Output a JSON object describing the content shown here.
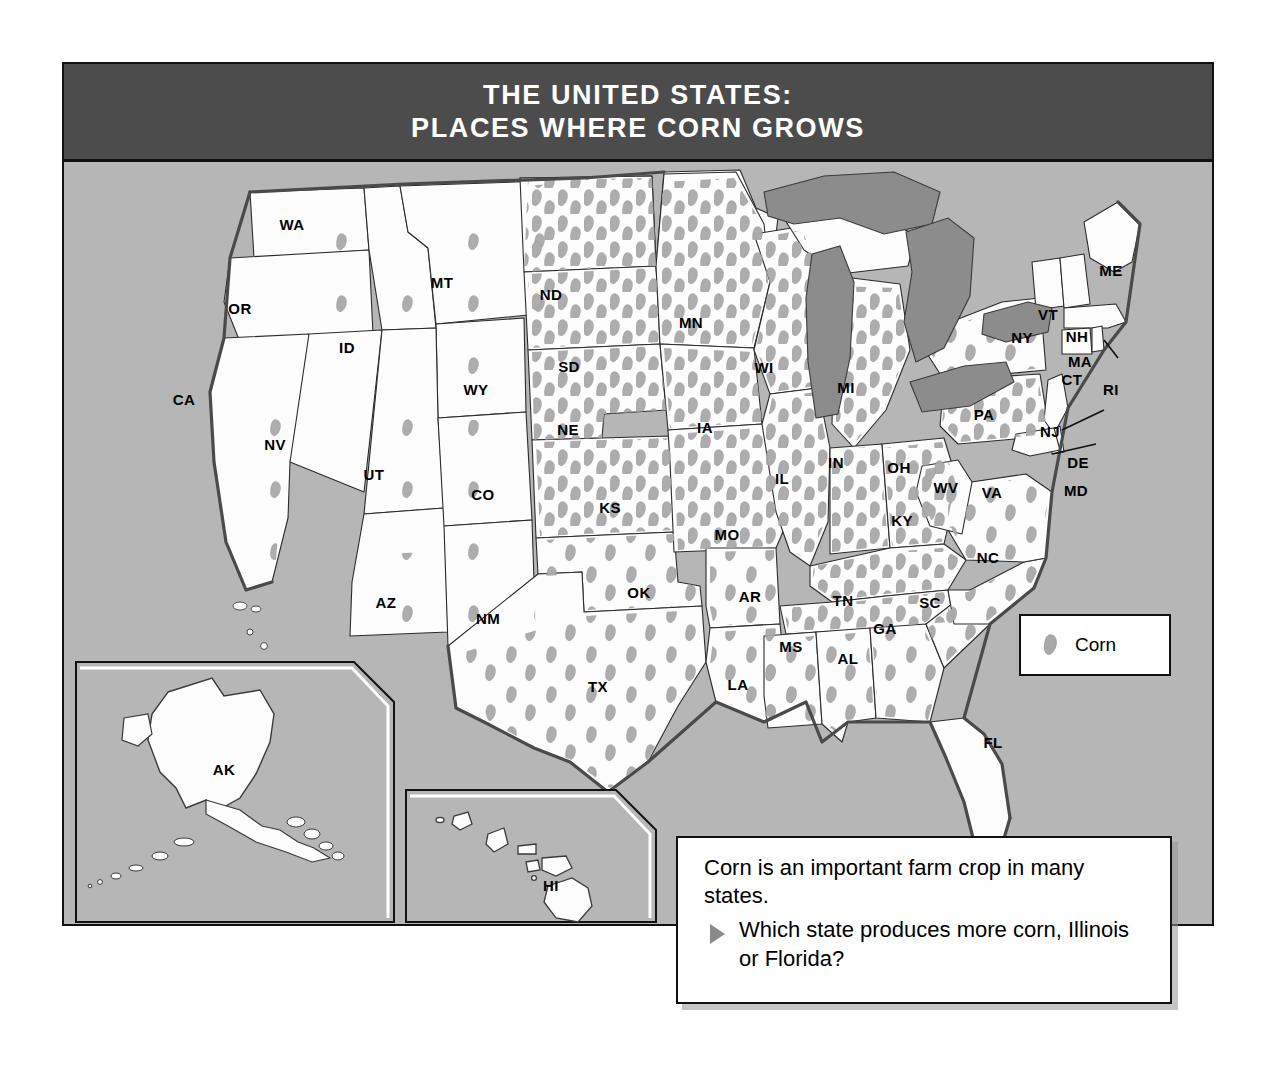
{
  "title": {
    "line1": "THE UNITED STATES:",
    "line2": "PLACES WHERE CORN GROWS"
  },
  "legend": {
    "symbol_name": "corn-symbol",
    "label": "Corn"
  },
  "question": {
    "intro": "Corn is an important farm crop in many states.",
    "bullet_icon": "triangle-right-icon",
    "text": "Which state produces more corn, Illinois or Florida?"
  },
  "colors": {
    "banner": "#4c4c4c",
    "map_background": "#b6b6b6",
    "state_fill": "#fdfdfd",
    "lake_fill": "#8c8c8c",
    "corn_symbol": "#a9a9a9",
    "border": "#111111"
  },
  "map": {
    "projection_note": "contiguous United States with Alaska and Hawaii insets",
    "states": [
      {
        "code": "WA",
        "x": 228,
        "y": 62,
        "corn": "low"
      },
      {
        "code": "OR",
        "x": 176,
        "y": 146,
        "corn": "low"
      },
      {
        "code": "CA",
        "x": 120,
        "y": 237,
        "corn": "low"
      },
      {
        "code": "NV",
        "x": 211,
        "y": 282,
        "corn": "none"
      },
      {
        "code": "ID",
        "x": 283,
        "y": 185,
        "corn": "low"
      },
      {
        "code": "MT",
        "x": 378,
        "y": 120,
        "corn": "low"
      },
      {
        "code": "WY",
        "x": 412,
        "y": 227,
        "corn": "low"
      },
      {
        "code": "UT",
        "x": 310,
        "y": 312,
        "corn": "low"
      },
      {
        "code": "AZ",
        "x": 322,
        "y": 440,
        "corn": "low"
      },
      {
        "code": "CO",
        "x": 419,
        "y": 332,
        "corn": "low"
      },
      {
        "code": "NM",
        "x": 424,
        "y": 456,
        "corn": "low"
      },
      {
        "code": "ND",
        "x": 487,
        "y": 132,
        "corn": "high"
      },
      {
        "code": "SD",
        "x": 505,
        "y": 204,
        "corn": "high"
      },
      {
        "code": "NE",
        "x": 504,
        "y": 267,
        "corn": "high"
      },
      {
        "code": "KS",
        "x": 546,
        "y": 345,
        "corn": "high"
      },
      {
        "code": "OK",
        "x": 575,
        "y": 430,
        "corn": "medium"
      },
      {
        "code": "TX",
        "x": 534,
        "y": 524,
        "corn": "medium"
      },
      {
        "code": "MN",
        "x": 627,
        "y": 160,
        "corn": "high"
      },
      {
        "code": "IA",
        "x": 641,
        "y": 265,
        "corn": "high"
      },
      {
        "code": "MO",
        "x": 663,
        "y": 372,
        "corn": "high"
      },
      {
        "code": "AR",
        "x": 686,
        "y": 434,
        "corn": "medium"
      },
      {
        "code": "LA",
        "x": 674,
        "y": 522,
        "corn": "medium"
      },
      {
        "code": "WI",
        "x": 700,
        "y": 205,
        "corn": "high"
      },
      {
        "code": "IL",
        "x": 718,
        "y": 316,
        "corn": "high"
      },
      {
        "code": "MI",
        "x": 782,
        "y": 225,
        "corn": "high"
      },
      {
        "code": "IN",
        "x": 772,
        "y": 300,
        "corn": "high"
      },
      {
        "code": "OH",
        "x": 835,
        "y": 305,
        "corn": "high"
      },
      {
        "code": "KY",
        "x": 838,
        "y": 358,
        "corn": "high"
      },
      {
        "code": "TN",
        "x": 779,
        "y": 438,
        "corn": "high"
      },
      {
        "code": "MS",
        "x": 727,
        "y": 484,
        "corn": "medium"
      },
      {
        "code": "AL",
        "x": 784,
        "y": 496,
        "corn": "medium"
      },
      {
        "code": "GA",
        "x": 821,
        "y": 466,
        "corn": "medium"
      },
      {
        "code": "FL",
        "x": 929,
        "y": 580,
        "corn": "none"
      },
      {
        "code": "SC",
        "x": 866,
        "y": 440,
        "corn": "medium"
      },
      {
        "code": "NC",
        "x": 924,
        "y": 395,
        "corn": "medium"
      },
      {
        "code": "VA",
        "x": 928,
        "y": 330,
        "corn": "medium"
      },
      {
        "code": "WV",
        "x": 882,
        "y": 325,
        "corn": "medium"
      },
      {
        "code": "PA",
        "x": 920,
        "y": 252,
        "corn": "high"
      },
      {
        "code": "NY",
        "x": 958,
        "y": 175,
        "corn": "medium"
      },
      {
        "code": "VT",
        "x": 984,
        "y": 152,
        "corn": "none"
      },
      {
        "code": "NH",
        "x": 1013,
        "y": 174,
        "corn": "none"
      },
      {
        "code": "ME",
        "x": 1047,
        "y": 108,
        "corn": "none"
      },
      {
        "code": "MA",
        "x": 1016,
        "y": 199,
        "corn": "none"
      },
      {
        "code": "CT",
        "x": 1008,
        "y": 217,
        "corn": "none"
      },
      {
        "code": "RI",
        "x": 1047,
        "y": 227,
        "corn": "none"
      },
      {
        "code": "NJ",
        "x": 986,
        "y": 269,
        "corn": "none"
      },
      {
        "code": "DE",
        "x": 1014,
        "y": 300,
        "corn": "none"
      },
      {
        "code": "MD",
        "x": 1012,
        "y": 328,
        "corn": "none"
      },
      {
        "code": "AK",
        "x": 160,
        "y": 607,
        "corn": "none"
      },
      {
        "code": "HI",
        "x": 487,
        "y": 723,
        "corn": "none"
      }
    ],
    "insets": [
      {
        "name": "alaska-inset",
        "label": "AK"
      },
      {
        "name": "hawaii-inset",
        "label": "HI"
      }
    ],
    "water_features": [
      "Lake Superior",
      "Lake Michigan",
      "Lake Huron",
      "Lake Erie",
      "Lake Ontario"
    ]
  }
}
